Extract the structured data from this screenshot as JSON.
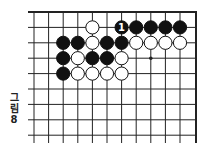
{
  "caption": {
    "chars": [
      "그",
      "림",
      "8"
    ]
  },
  "board": {
    "columns": 12,
    "rows": 9,
    "x0": 34,
    "dx": 14.6,
    "y0": 12,
    "dy": 15.4,
    "left_extend": 28,
    "right_edge": 196,
    "bottom_extend": 143,
    "top_edge": true,
    "right_edge_border": true,
    "stone_radius": 6.6,
    "line_color": "#222222",
    "black_color": "#111111",
    "white_color": "#ffffff",
    "star_points": [
      [
        8,
        3
      ]
    ],
    "stones": [
      {
        "col": 4,
        "row": 1,
        "color": "white"
      },
      {
        "col": 6,
        "row": 1,
        "color": "black",
        "label": "1"
      },
      {
        "col": 7,
        "row": 1,
        "color": "black"
      },
      {
        "col": 8,
        "row": 1,
        "color": "black"
      },
      {
        "col": 9,
        "row": 1,
        "color": "black"
      },
      {
        "col": 10,
        "row": 1,
        "color": "black"
      },
      {
        "col": 2,
        "row": 2,
        "color": "black"
      },
      {
        "col": 3,
        "row": 2,
        "color": "black"
      },
      {
        "col": 4,
        "row": 2,
        "color": "white"
      },
      {
        "col": 5,
        "row": 2,
        "color": "black"
      },
      {
        "col": 6,
        "row": 2,
        "color": "black"
      },
      {
        "col": 7,
        "row": 2,
        "color": "white"
      },
      {
        "col": 8,
        "row": 2,
        "color": "white"
      },
      {
        "col": 9,
        "row": 2,
        "color": "white"
      },
      {
        "col": 10,
        "row": 2,
        "color": "white"
      },
      {
        "col": 2,
        "row": 3,
        "color": "black"
      },
      {
        "col": 3,
        "row": 3,
        "color": "white"
      },
      {
        "col": 4,
        "row": 3,
        "color": "black"
      },
      {
        "col": 5,
        "row": 3,
        "color": "black"
      },
      {
        "col": 6,
        "row": 3,
        "color": "white"
      },
      {
        "col": 2,
        "row": 4,
        "color": "black"
      },
      {
        "col": 3,
        "row": 4,
        "color": "white"
      },
      {
        "col": 4,
        "row": 4,
        "color": "white"
      },
      {
        "col": 5,
        "row": 4,
        "color": "white"
      },
      {
        "col": 6,
        "row": 4,
        "color": "white"
      }
    ]
  }
}
